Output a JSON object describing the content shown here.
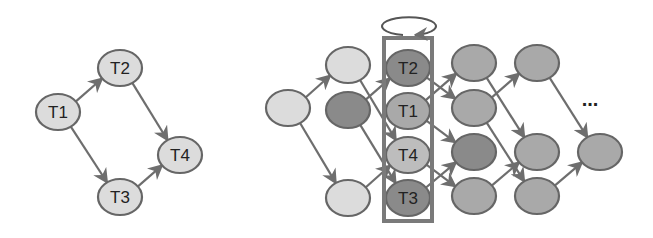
{
  "colors": {
    "light": "#dcdcdc",
    "medium": "#a9a9a9",
    "dark": "#8a8a8a",
    "mid_light": "#bdbdbd",
    "stroke": "#666666",
    "edge": "#6e6e6e",
    "box": "#7a7a7a"
  },
  "left_graph": {
    "nodes": [
      {
        "id": "T1",
        "label": "T1",
        "x": 58,
        "y": 112,
        "fill": "light"
      },
      {
        "id": "T2",
        "label": "T2",
        "x": 120,
        "y": 68,
        "fill": "light"
      },
      {
        "id": "T3",
        "label": "T3",
        "x": 120,
        "y": 197,
        "fill": "light"
      },
      {
        "id": "T4",
        "label": "T4",
        "x": 180,
        "y": 155,
        "fill": "light"
      }
    ],
    "edges": [
      [
        "T1",
        "T2"
      ],
      [
        "T1",
        "T3"
      ],
      [
        "T2",
        "T4"
      ],
      [
        "T3",
        "T4"
      ]
    ]
  },
  "right_graph": {
    "nodes": [
      {
        "id": "a0",
        "label": "",
        "x": 288,
        "y": 108,
        "fill": "light"
      },
      {
        "id": "b0",
        "label": "",
        "x": 348,
        "y": 65,
        "fill": "light"
      },
      {
        "id": "b1",
        "label": "",
        "x": 348,
        "y": 110,
        "fill": "dark"
      },
      {
        "id": "b2",
        "label": "",
        "x": 348,
        "y": 198,
        "fill": "light"
      },
      {
        "id": "c0",
        "label": "T2",
        "x": 408,
        "y": 68,
        "fill": "dark"
      },
      {
        "id": "c1",
        "label": "T1",
        "x": 408,
        "y": 111,
        "fill": "medium"
      },
      {
        "id": "c2",
        "label": "T4",
        "x": 408,
        "y": 155,
        "fill": "mid_light"
      },
      {
        "id": "c3",
        "label": "T3",
        "x": 408,
        "y": 198,
        "fill": "dark"
      },
      {
        "id": "d0",
        "label": "",
        "x": 474,
        "y": 63,
        "fill": "medium"
      },
      {
        "id": "d1",
        "label": "",
        "x": 474,
        "y": 108,
        "fill": "medium"
      },
      {
        "id": "d2",
        "label": "",
        "x": 474,
        "y": 152,
        "fill": "dark"
      },
      {
        "id": "d3",
        "label": "",
        "x": 474,
        "y": 196,
        "fill": "medium"
      },
      {
        "id": "e0",
        "label": "",
        "x": 537,
        "y": 63,
        "fill": "medium"
      },
      {
        "id": "e1",
        "label": "",
        "x": 537,
        "y": 152,
        "fill": "medium"
      },
      {
        "id": "e2",
        "label": "",
        "x": 537,
        "y": 196,
        "fill": "medium"
      },
      {
        "id": "f0",
        "label": "",
        "x": 600,
        "y": 152,
        "fill": "medium"
      }
    ],
    "edges": [
      [
        "a0",
        "b0"
      ],
      [
        "a0",
        "b2"
      ],
      [
        "b0",
        "c2"
      ],
      [
        "b1",
        "c0"
      ],
      [
        "b1",
        "c3"
      ],
      [
        "b2",
        "c2"
      ],
      [
        "c0",
        "d1"
      ],
      [
        "c1",
        "d0"
      ],
      [
        "c1",
        "d2"
      ],
      [
        "c2",
        "d3"
      ],
      [
        "c3",
        "d2"
      ],
      [
        "d0",
        "e1"
      ],
      [
        "d1",
        "e0"
      ],
      [
        "d1",
        "e2"
      ],
      [
        "d3",
        "e1"
      ],
      [
        "e0",
        "f0"
      ],
      [
        "e2",
        "f0"
      ]
    ],
    "ellipsis": {
      "label": "...",
      "x": 590,
      "y": 106
    },
    "highlight_box": {
      "x": 384,
      "y": 38,
      "width": 48,
      "height": 183
    },
    "loop": {
      "cx": 409,
      "cy": 26,
      "rx": 27,
      "ry": 9
    }
  }
}
